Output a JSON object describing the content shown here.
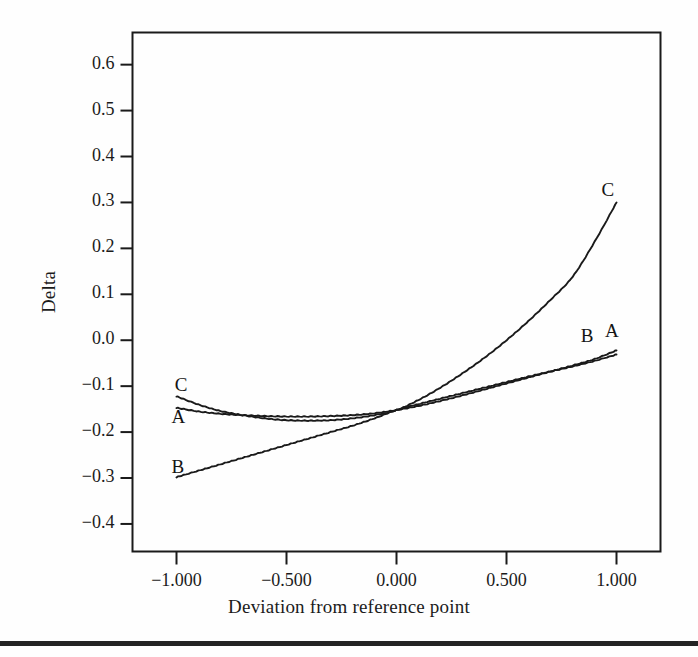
{
  "figure": {
    "background_color": "#fefefe",
    "line_color": "#1a1a1a",
    "bottom_rule_color": "#232323"
  },
  "chart_data": {
    "type": "line",
    "title": "",
    "xlabel": "Deviation from reference point",
    "ylabel": "Delta",
    "xlim": [
      -1.2,
      1.2
    ],
    "ylim": [
      -0.46,
      0.67
    ],
    "grid": false,
    "legend": "inline-curve-labels",
    "x_ticks": [
      -1.0,
      -0.5,
      0.0,
      0.5,
      1.0
    ],
    "x_tick_labels": [
      "−1.000",
      "−0.500",
      "0.000",
      "0.500",
      "1.000"
    ],
    "y_ticks": [
      0.6,
      0.5,
      0.4,
      0.3,
      0.2,
      0.1,
      0.0,
      -0.1,
      -0.2,
      -0.3,
      -0.4
    ],
    "y_tick_labels": [
      "0.6",
      "0.5",
      "0.4",
      "0.3",
      "0.2",
      "0.1",
      "0.0",
      "−0.1",
      "−0.2",
      "−0.3",
      "−0.4"
    ],
    "x": [
      -1.0,
      -0.9,
      -0.8,
      -0.7,
      -0.6,
      -0.5,
      -0.4,
      -0.3,
      -0.2,
      -0.1,
      0.0,
      0.1,
      0.2,
      0.3,
      0.4,
      0.5,
      0.6,
      0.7,
      0.8,
      0.9,
      1.0
    ],
    "series": [
      {
        "name": "A",
        "label": "A",
        "values": [
          -0.147,
          -0.155,
          -0.16,
          -0.163,
          -0.165,
          -0.166,
          -0.166,
          -0.165,
          -0.163,
          -0.159,
          -0.152,
          -0.143,
          -0.132,
          -0.12,
          -0.107,
          -0.094,
          -0.081,
          -0.068,
          -0.055,
          -0.041,
          -0.022
        ],
        "label_left": {
          "x": -1.0,
          "y": -0.172
        },
        "label_right": {
          "x": 0.97,
          "y": 0.015
        }
      },
      {
        "name": "B",
        "label": "B",
        "values": [
          -0.298,
          -0.284,
          -0.27,
          -0.256,
          -0.242,
          -0.228,
          -0.214,
          -0.2,
          -0.186,
          -0.17,
          -0.152,
          -0.139,
          -0.127,
          -0.115,
          -0.103,
          -0.091,
          -0.079,
          -0.068,
          -0.057,
          -0.045,
          -0.031
        ],
        "label_left": {
          "x": -1.0,
          "y": -0.281
        },
        "label_right": {
          "x": 0.86,
          "y": 0.004
        }
      },
      {
        "name": "C",
        "label": "C",
        "values": [
          -0.122,
          -0.14,
          -0.154,
          -0.163,
          -0.17,
          -0.174,
          -0.175,
          -0.174,
          -0.17,
          -0.163,
          -0.152,
          -0.13,
          -0.103,
          -0.072,
          -0.038,
          0.0,
          0.042,
          0.088,
          0.138,
          0.214,
          0.3
        ],
        "label_left": {
          "x": -0.985,
          "y": -0.101
        },
        "label_right": {
          "x": 0.955,
          "y": 0.322
        }
      }
    ]
  },
  "axes": {
    "x_title": "Deviation from reference point",
    "y_title": "Delta"
  }
}
